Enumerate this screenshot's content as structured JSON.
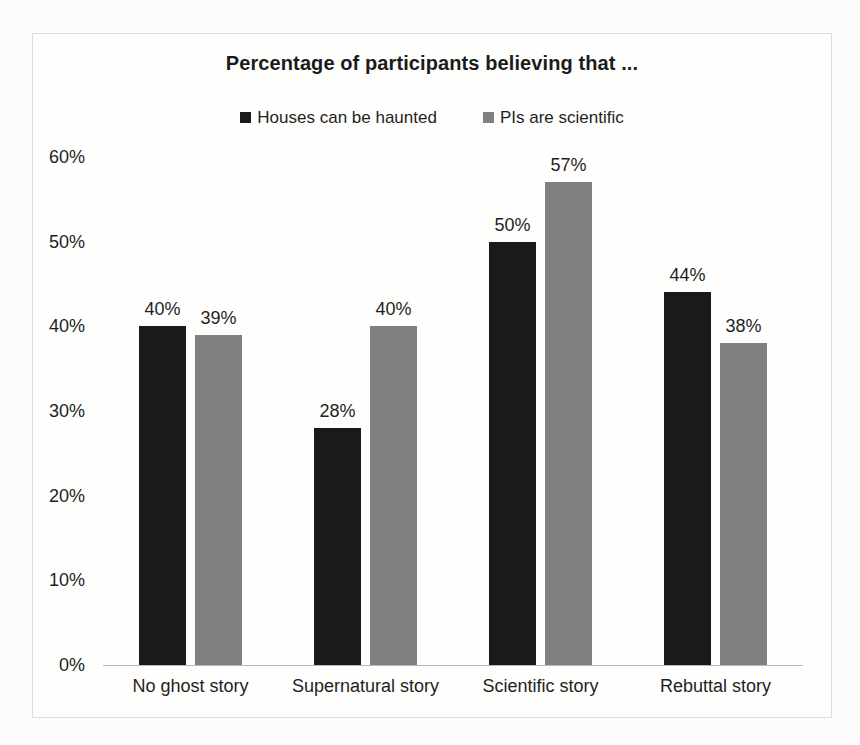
{
  "chart_data": {
    "type": "bar",
    "title": "Percentage of participants believing that ...",
    "xlabel": "",
    "ylabel": "",
    "ylim": [
      0,
      60
    ],
    "ytick_labels": [
      "60%",
      "50%",
      "40%",
      "30%",
      "20%",
      "10%",
      "0%"
    ],
    "ytick_values": [
      60,
      50,
      40,
      30,
      20,
      10,
      0
    ],
    "grid": false,
    "legend_position": "top-center",
    "categories": [
      "No ghost story",
      "Supernatural story",
      "Scientific story",
      "Rebuttal story"
    ],
    "series": [
      {
        "name": "Houses can be haunted",
        "color": "#1a1a1a",
        "values": [
          40,
          28,
          50,
          44
        ],
        "value_labels": [
          "40%",
          "28%",
          "50%",
          "44%"
        ]
      },
      {
        "name": "PIs are scientific",
        "color": "#808080",
        "values": [
          39,
          40,
          57,
          38
        ],
        "value_labels": [
          "39%",
          "40%",
          "57%",
          "38%"
        ]
      }
    ]
  }
}
